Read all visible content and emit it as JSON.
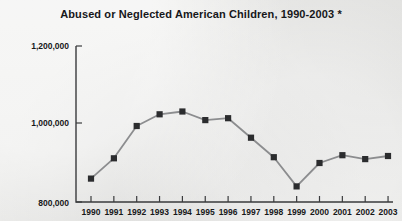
{
  "chart_data": {
    "type": "line",
    "title": "Abused or Neglected American Children, 1990-2003 *",
    "xlabel": "",
    "ylabel": "",
    "categories": [
      "1990",
      "1991",
      "1992",
      "1993",
      "1994",
      "1995",
      "1996",
      "1997",
      "1998",
      "1999",
      "2000",
      "2001",
      "2002",
      "2003"
    ],
    "values": [
      860000,
      912000,
      995000,
      1025000,
      1032000,
      1010000,
      1015000,
      965000,
      915000,
      840000,
      900000,
      920000,
      910000,
      918000
    ],
    "series": [
      {
        "name": "Abused or neglected children",
        "values": [
          860000,
          912000,
          995000,
          1025000,
          1032000,
          1010000,
          1015000,
          965000,
          915000,
          840000,
          900000,
          920000,
          910000,
          918000
        ]
      }
    ],
    "ylim": [
      800000,
      1200000
    ],
    "ytick_labels": [
      "1,200,000",
      "1,000,000",
      "800,000"
    ],
    "ytick_values": [
      1200000,
      1000000,
      800000
    ],
    "xtick_labels": [
      "1990",
      "1991",
      "1992",
      "1993",
      "1994",
      "1995",
      "1996",
      "1997",
      "1998",
      "1999",
      "2000",
      "2001",
      "2002",
      "2003"
    ],
    "grid": false,
    "legend": "none",
    "marker": "square",
    "line_color": "#8c8d8f",
    "marker_color": "#2b2c2e",
    "axis_color": "#3a3b3d",
    "background_color": "#e9e9e7",
    "footnote_marker": "*"
  }
}
